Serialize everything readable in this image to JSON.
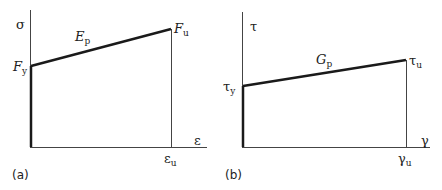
{
  "panels": [
    {
      "caption": "(a)",
      "y_axis_label": "σ",
      "x_axis_label": "ε",
      "yield_label": {
        "main": "F",
        "sub": "y"
      },
      "ultimate_label": {
        "main": "F",
        "sub": "u"
      },
      "slope_label": {
        "main": "E",
        "sub": "p"
      },
      "x_ultimate_label": {
        "main": "ε",
        "sub": "u"
      }
    },
    {
      "caption": "(b)",
      "y_axis_label": "τ",
      "x_axis_label": "γ",
      "yield_label": {
        "main": "τ",
        "sub": "y"
      },
      "ultimate_label": {
        "main": "τ",
        "sub": "u"
      },
      "slope_label": {
        "main": "G",
        "sub": "p"
      },
      "x_ultimate_label": {
        "main": "γ",
        "sub": "u"
      }
    }
  ],
  "colors": {
    "line": "#1a1a1a",
    "axis": "#333333"
  }
}
